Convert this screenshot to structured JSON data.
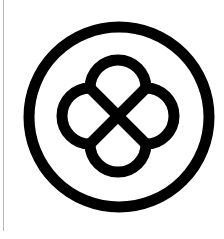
{
  "image": {
    "description": "Circular emblem with quatrefoil knot",
    "colors": {
      "foreground": "#000000",
      "background": "#ffffff",
      "edge_line": "#b8b8b8"
    },
    "icon": "quatrefoil-knot-in-circle-icon"
  }
}
